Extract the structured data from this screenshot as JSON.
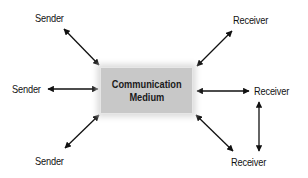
{
  "diagram": {
    "center": {
      "line1": "Communication",
      "line2": "Medium",
      "fill": "#c8c8c8"
    },
    "nodes": [
      {
        "id": "sender-top",
        "label": "Sender"
      },
      {
        "id": "sender-middle",
        "label": "Sender"
      },
      {
        "id": "sender-bottom",
        "label": "Sender"
      },
      {
        "id": "receiver-top",
        "label": "Receiver"
      },
      {
        "id": "receiver-middle",
        "label": "Receiver"
      },
      {
        "id": "receiver-bottom",
        "label": "Receiver"
      }
    ],
    "edges": [
      {
        "from": "sender-top",
        "to": "medium",
        "type": "bidirectional"
      },
      {
        "from": "sender-middle",
        "to": "medium",
        "type": "bidirectional"
      },
      {
        "from": "sender-bottom",
        "to": "medium",
        "type": "bidirectional"
      },
      {
        "from": "receiver-top",
        "to": "medium",
        "type": "bidirectional"
      },
      {
        "from": "receiver-middle",
        "to": "medium",
        "type": "bidirectional"
      },
      {
        "from": "receiver-bottom",
        "to": "medium",
        "type": "bidirectional"
      },
      {
        "from": "receiver-middle",
        "to": "receiver-bottom",
        "type": "bidirectional"
      }
    ]
  }
}
